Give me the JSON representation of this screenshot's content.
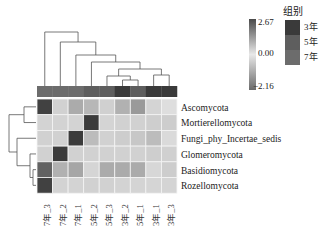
{
  "chart_data": {
    "type": "heatmap",
    "title": "",
    "rows": [
      "Ascomycota",
      "Mortierellomycota",
      "Fungi_phy_Incertae_sedis",
      "Glomeromycota",
      "Basidiomycota",
      "Rozellomycota"
    ],
    "columns": [
      "7年_3",
      "7年_2",
      "7年_1",
      "5年_2",
      "5年_3",
      "3年_2",
      "5年_1",
      "3年_1",
      "3年_3"
    ],
    "column_groups": [
      "7年",
      "7年",
      "7年",
      "5年",
      "5年",
      "3年",
      "5年",
      "3年",
      "3年"
    ],
    "values": [
      [
        2.5,
        -0.3,
        0.6,
        0.4,
        -0.2,
        0.5,
        0.9,
        -0.5,
        -1.2
      ],
      [
        -0.4,
        -0.4,
        -0.4,
        2.6,
        -0.5,
        -0.3,
        -0.3,
        -0.1,
        0.0
      ],
      [
        -0.3,
        -0.3,
        2.6,
        0.3,
        -0.3,
        0.0,
        0.1,
        0.3,
        -0.9
      ],
      [
        -0.3,
        2.6,
        -0.3,
        -0.3,
        -0.3,
        -0.3,
        -0.3,
        -0.1,
        -0.2
      ],
      [
        1.9,
        0.5,
        0.7,
        -0.6,
        0.6,
        0.6,
        0.6,
        -0.7,
        0.0
      ],
      [
        2.5,
        -0.4,
        -0.4,
        -0.3,
        -0.3,
        -0.4,
        -0.5,
        -0.6,
        -0.5
      ]
    ],
    "colorscale": {
      "min": -2.16,
      "mid": 0.0,
      "max": 2.67,
      "ticks": [
        "2.67",
        "0.00",
        "−2.16"
      ]
    },
    "legend": {
      "title": "组别",
      "items": [
        {
          "label": "3年",
          "color": "#3a3a3a"
        },
        {
          "label": "5年",
          "color": "#5e5e5e"
        },
        {
          "label": "7年",
          "color": "#6c6c6c"
        }
      ]
    },
    "row_dendrogram": true,
    "column_dendrogram": true
  }
}
